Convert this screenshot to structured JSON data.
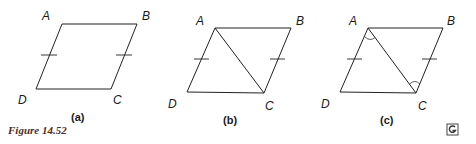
{
  "figure": {
    "title": "Figure 14.52",
    "logo_icon": "G-logo-icon",
    "colors": {
      "stroke": "#222222",
      "title": "#5a2a1a",
      "background": "#ffffff"
    }
  },
  "panels": [
    {
      "caption": "(a)",
      "vertices": {
        "A": "A",
        "B": "B",
        "C": "C",
        "D": "D"
      },
      "diagonal": false,
      "angle_marks": false,
      "tick_marks": [
        "AD",
        "BC"
      ]
    },
    {
      "caption": "(b)",
      "vertices": {
        "A": "A",
        "B": "B",
        "C": "C",
        "D": "D"
      },
      "diagonal": "AC",
      "angle_marks": false,
      "tick_marks": [
        "AD",
        "BC"
      ]
    },
    {
      "caption": "(c)",
      "vertices": {
        "A": "A",
        "B": "B",
        "C": "C",
        "D": "D"
      },
      "diagonal": "AC",
      "angle_marks": [
        "angle CAD at A",
        "angle ACB at C"
      ],
      "tick_marks": [
        "AD",
        "BC"
      ]
    }
  ]
}
